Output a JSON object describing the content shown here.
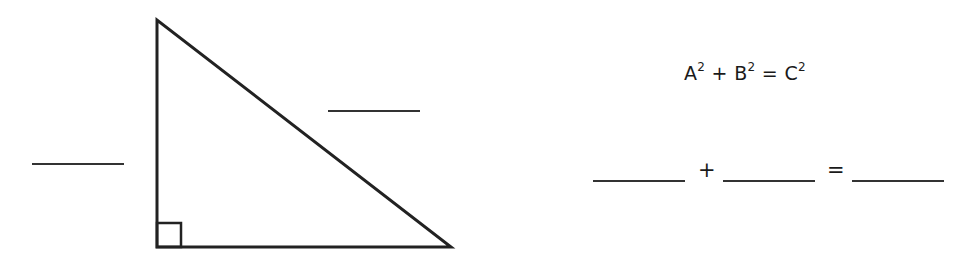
{
  "triangle": {
    "label": "right triangle",
    "vertices": {
      "top": [
        157,
        20
      ],
      "bottom_left": [
        157,
        247
      ],
      "bottom_right": [
        451,
        247
      ]
    },
    "right_angle_marker": {
      "x": 157,
      "y": 223,
      "size": 24
    },
    "stroke_color": "#222222"
  },
  "side_blanks": [
    {
      "name": "left-leg-blank",
      "x": 32,
      "y": 163,
      "width": 92
    },
    {
      "name": "hypotenuse-blank",
      "x": 328,
      "y": 110,
      "width": 92
    }
  ],
  "formula": {
    "a": "A",
    "b": "B",
    "c": "C",
    "exp": "2",
    "plus": "+",
    "equals": "="
  },
  "answer_row": {
    "plus": "+",
    "equals": "="
  }
}
